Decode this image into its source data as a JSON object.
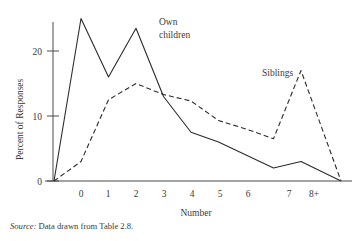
{
  "figure": {
    "source_note_prefix": "Source:",
    "source_note_text": "Data drawn from Table 2.8."
  },
  "chart_data": {
    "type": "line",
    "title": "",
    "xlabel": "Number",
    "ylabel": "Percent of Responses",
    "categories": [
      "0",
      "1",
      "2",
      "3",
      "4",
      "5",
      "6",
      "7",
      "8+"
    ],
    "xtick_labels": [
      "0",
      "1",
      "2",
      "3",
      "4",
      "5",
      "6",
      "7",
      "8+"
    ],
    "ytick_labels": [
      "0",
      "10",
      "20"
    ],
    "yticks": [
      0,
      10,
      20
    ],
    "ylim": [
      0,
      26
    ],
    "grid": false,
    "legend_position": "inline-annotations",
    "series": [
      {
        "name": "Own children",
        "style": "solid",
        "label_line1": "Own",
        "label_line2": "children",
        "values": [
          25,
          16,
          23.5,
          13,
          7.5,
          6,
          4,
          2,
          3
        ],
        "starts_at_zero_before_first": true,
        "ends_at_zero_after_last": true
      },
      {
        "name": "Siblings",
        "style": "dashed",
        "label_line1": "Siblings",
        "label_line2": "",
        "values": [
          3,
          12.5,
          15,
          13.3,
          12.3,
          9.3,
          8,
          6.5,
          17
        ],
        "starts_at_zero_before_first": true,
        "ends_at_zero_after_last": true
      }
    ]
  }
}
